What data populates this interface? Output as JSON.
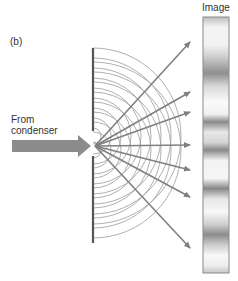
{
  "panel": {
    "label": "(b)"
  },
  "labels": {
    "source_line1": "From",
    "source_line2": "condenser",
    "image": "Image"
  },
  "diagram": {
    "colors": {
      "barrier": "#555555",
      "wavefront": "#9a9a9a",
      "ray": "#808080",
      "source_arrow": "#8c8c8c",
      "image_frame": "#8a8a8a"
    },
    "barrier": {
      "x": 92,
      "upper": [
        48,
        131
      ],
      "lower": [
        156,
        243
      ]
    },
    "slits_y": [
      136,
      150
    ],
    "ray_tip_y": [
      42,
      92,
      112,
      145,
      170,
      197,
      248
    ],
    "image_bands_dark_y": [
      40,
      65,
      100,
      145,
      180,
      235
    ]
  }
}
